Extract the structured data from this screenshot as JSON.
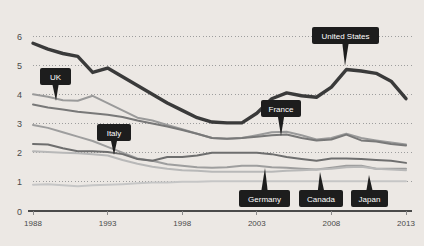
{
  "chart_data": {
    "type": "line",
    "title": "",
    "subtitle": "",
    "xlabel": "",
    "ylabel": "",
    "xlim": [
      1988,
      2013
    ],
    "ylim": [
      0,
      6
    ],
    "grid": true,
    "legend_position": "inline-callouts",
    "x": [
      1988,
      1989,
      1990,
      1991,
      1992,
      1993,
      1994,
      1995,
      1996,
      1997,
      1998,
      1999,
      2000,
      2001,
      2002,
      2003,
      2004,
      2005,
      2006,
      2007,
      2008,
      2009,
      2010,
      2011,
      2012,
      2013
    ],
    "y_ticks": [
      "0",
      "1",
      "2",
      "3",
      "4",
      "5",
      "6"
    ],
    "x_ticks": [
      "1988",
      "1993",
      "1998",
      "2003",
      "2008",
      "2013"
    ],
    "series": [
      {
        "name": "United States",
        "color": "#3a3a3a",
        "width": 3.4,
        "values": [
          5.75,
          5.55,
          5.4,
          5.3,
          4.75,
          4.9,
          4.6,
          4.3,
          4.0,
          3.7,
          3.45,
          3.2,
          3.05,
          3.02,
          3.02,
          3.35,
          3.85,
          4.05,
          3.95,
          3.9,
          4.25,
          4.85,
          4.8,
          4.72,
          4.45,
          3.85
        ]
      },
      {
        "name": "UK",
        "color": "#9a9a9a",
        "width": 2.0,
        "values": [
          4.0,
          3.92,
          3.8,
          3.78,
          3.95,
          3.7,
          3.45,
          3.2,
          3.1,
          2.95,
          2.8,
          2.65,
          2.5,
          2.48,
          2.5,
          2.6,
          2.7,
          2.72,
          2.6,
          2.45,
          2.5,
          2.65,
          2.5,
          2.42,
          2.35,
          2.28
        ]
      },
      {
        "name": "France",
        "color": "#787878",
        "width": 2.0,
        "values": [
          3.65,
          3.55,
          3.48,
          3.4,
          3.35,
          3.3,
          3.22,
          3.1,
          3.0,
          2.9,
          2.78,
          2.65,
          2.5,
          2.48,
          2.5,
          2.55,
          2.6,
          2.62,
          2.5,
          2.42,
          2.45,
          2.62,
          2.42,
          2.38,
          2.3,
          2.25
        ]
      },
      {
        "name": "Italy",
        "color": "#9e9e9e",
        "width": 2.0,
        "values": [
          2.95,
          2.85,
          2.7,
          2.55,
          2.4,
          2.2,
          2.0,
          1.8,
          1.72,
          1.6,
          1.55,
          1.5,
          1.48,
          1.5,
          1.55,
          1.55,
          1.5,
          1.48,
          1.45,
          1.42,
          1.48,
          1.55,
          1.55,
          1.45,
          1.45,
          1.45
        ]
      },
      {
        "name": "Germany",
        "color": "#6e6e6e",
        "width": 2.0,
        "values": [
          2.3,
          2.28,
          2.15,
          2.05,
          2.05,
          2.02,
          1.95,
          1.78,
          1.72,
          1.85,
          1.85,
          1.9,
          2.0,
          2.0,
          2.0,
          2.0,
          1.95,
          1.85,
          1.78,
          1.72,
          1.8,
          1.8,
          1.78,
          1.75,
          1.72,
          1.65
        ]
      },
      {
        "name": "Canada",
        "color": "#b8b8b8",
        "width": 2.0,
        "values": [
          2.05,
          2.02,
          2.0,
          1.98,
          1.95,
          1.9,
          1.75,
          1.62,
          1.52,
          1.45,
          1.4,
          1.38,
          1.35,
          1.35,
          1.35,
          1.35,
          1.35,
          1.38,
          1.4,
          1.42,
          1.45,
          1.5,
          1.52,
          1.45,
          1.42,
          1.4
        ]
      },
      {
        "name": "Japan",
        "color": "#c6c6c6",
        "width": 2.0,
        "values": [
          0.9,
          0.92,
          0.88,
          0.85,
          0.88,
          0.9,
          0.92,
          0.95,
          0.98,
          0.98,
          1.0,
          1.0,
          1.02,
          1.02,
          1.02,
          1.02,
          1.02,
          1.02,
          1.02,
          1.02,
          1.02,
          1.02,
          1.02,
          1.02,
          1.02,
          1.02
        ]
      }
    ],
    "callouts": [
      {
        "label": "UK",
        "box_x": 40,
        "box_y": 68,
        "box_w": 31,
        "box_h": 17,
        "tip_x": 56,
        "tip_y": 101
      },
      {
        "label": "Italy",
        "box_x": 97,
        "box_y": 124,
        "box_w": 34,
        "box_h": 17,
        "tip_x": 114,
        "tip_y": 155
      },
      {
        "label": "United States",
        "box_x": 312,
        "box_y": 27,
        "box_w": 67,
        "box_h": 17,
        "tip_x": 345,
        "tip_y": 66
      },
      {
        "label": "France",
        "box_x": 261,
        "box_y": 100,
        "box_w": 40,
        "box_h": 17,
        "tip_x": 281,
        "tip_y": 136
      },
      {
        "label": "Germany",
        "box_x": 239,
        "box_y": 190,
        "box_w": 51,
        "box_h": 17,
        "tip_x": 265,
        "tip_y": 168
      },
      {
        "label": "Canada",
        "box_x": 299,
        "box_y": 190,
        "box_w": 44,
        "box_h": 17,
        "tip_x": 320,
        "tip_y": 172
      },
      {
        "label": "Japan",
        "box_x": 351,
        "box_y": 190,
        "box_w": 37,
        "box_h": 17,
        "tip_x": 369,
        "tip_y": 175
      }
    ]
  }
}
